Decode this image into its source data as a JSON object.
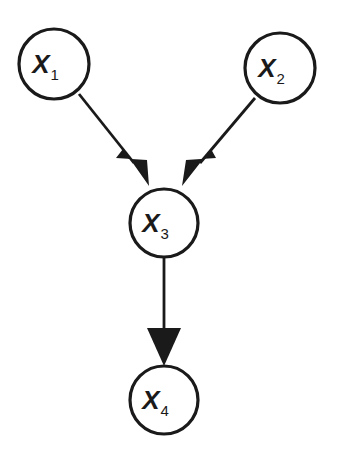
{
  "figure": {
    "kind": "causal-dag",
    "background_color": "#ffffff",
    "stroke_color": "#1a1a1a",
    "node_fill_color": "#ffffff",
    "width": 338,
    "height": 460
  },
  "nodes": [
    {
      "id": "X1",
      "label_main": "X",
      "label_sub": "1",
      "label_full": "X1",
      "cx": 54,
      "cy": 64,
      "r": 35,
      "stroke_width": 3.2
    },
    {
      "id": "X2",
      "label_main": "X",
      "label_sub": "2",
      "label_full": "X2",
      "cx": 280,
      "cy": 68,
      "r": 35,
      "stroke_width": 3.2
    },
    {
      "id": "X3",
      "label_main": "X",
      "label_sub": "3",
      "label_full": "X3",
      "cx": 164,
      "cy": 223,
      "r": 34,
      "stroke_width": 3.2
    },
    {
      "id": "X4",
      "label_main": "X",
      "label_sub": "4",
      "label_full": "X4",
      "cx": 164,
      "cy": 400,
      "r": 34,
      "stroke_width": 3.2
    }
  ],
  "edges": [
    {
      "id": "e1",
      "from": "X1",
      "to": "X3",
      "line": "M 79,94 L 134,163",
      "arrow": "M 123,149 L 149,186 L 147,160 L 116,158 Z",
      "stroke_width": 2.8
    },
    {
      "id": "e2",
      "from": "X2",
      "to": "X3",
      "line": "M 255,98 L 200,163",
      "arrow": "M 211,149 L 182,186 L 186,160 L 216,158 Z",
      "stroke_width": 2.8
    },
    {
      "id": "e3",
      "from": "X3",
      "to": "X4",
      "line": "M 164,257 L 164,328",
      "arrow": "M 147,328 L 181,328 L 164,366 Z",
      "stroke_width": 2.8
    }
  ],
  "label_style": {
    "main_font_size": 26,
    "sub_font_size": 15,
    "sub_dx": 15,
    "sub_dy": 10,
    "main_dy": 2
  }
}
